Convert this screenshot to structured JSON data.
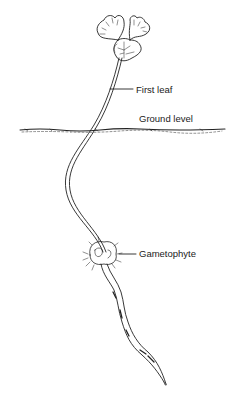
{
  "diagram": {
    "type": "botanical-illustration",
    "colors": {
      "ink": "#222222",
      "background": "#ffffff"
    },
    "labels": [
      {
        "id": "first_leaf",
        "text": "First leaf"
      },
      {
        "id": "ground_level",
        "text": "Ground level"
      },
      {
        "id": "gametophyte",
        "text": "Gametophyte"
      }
    ]
  },
  "labels": {
    "first_leaf": "First leaf",
    "ground_level": "Ground level",
    "gametophyte": "Gametophyte"
  }
}
